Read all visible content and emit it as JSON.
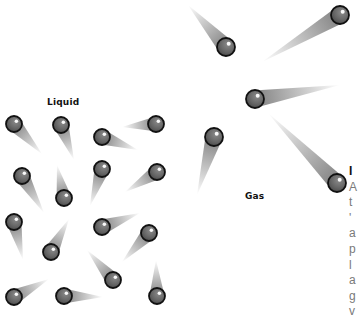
{
  "figure": {
    "background": "#ffffff",
    "ball_fill": "#6a6a6a",
    "ball_stroke": "#111111",
    "ball_highlight": "#ffffff",
    "tail_color": "#7a7a7a"
  },
  "labels": {
    "liquid": "Liquid",
    "gas": "Gas"
  },
  "liquid_particles": [
    {
      "x": 14,
      "y": 124,
      "tail_x": 42,
      "tail_y": 154
    },
    {
      "x": 61,
      "y": 125,
      "tail_x": 74,
      "tail_y": 160
    },
    {
      "x": 102,
      "y": 137,
      "tail_x": 138,
      "tail_y": 150
    },
    {
      "x": 156,
      "y": 124,
      "tail_x": 122,
      "tail_y": 127
    },
    {
      "x": 22,
      "y": 176,
      "tail_x": 44,
      "tail_y": 213
    },
    {
      "x": 64,
      "y": 198,
      "tail_x": 57,
      "tail_y": 165
    },
    {
      "x": 102,
      "y": 169,
      "tail_x": 90,
      "tail_y": 206
    },
    {
      "x": 157,
      "y": 172,
      "tail_x": 125,
      "tail_y": 192
    },
    {
      "x": 14,
      "y": 222,
      "tail_x": 23,
      "tail_y": 260
    },
    {
      "x": 51,
      "y": 252,
      "tail_x": 69,
      "tail_y": 219
    },
    {
      "x": 102,
      "y": 227,
      "tail_x": 140,
      "tail_y": 213
    },
    {
      "x": 149,
      "y": 233,
      "tail_x": 122,
      "tail_y": 262
    },
    {
      "x": 113,
      "y": 280,
      "tail_x": 87,
      "tail_y": 250
    },
    {
      "x": 14,
      "y": 297,
      "tail_x": 49,
      "tail_y": 279
    },
    {
      "x": 64,
      "y": 296,
      "tail_x": 103,
      "tail_y": 297
    },
    {
      "x": 157,
      "y": 296,
      "tail_x": 156,
      "tail_y": 260
    }
  ],
  "gas_particles": [
    {
      "x": 226,
      "y": 47,
      "tail_x": 188,
      "tail_y": 5
    },
    {
      "x": 340,
      "y": 15,
      "tail_x": 262,
      "tail_y": 62
    },
    {
      "x": 255,
      "y": 99,
      "tail_x": 340,
      "tail_y": 85
    },
    {
      "x": 214,
      "y": 137,
      "tail_x": 197,
      "tail_y": 195
    },
    {
      "x": 337,
      "y": 183,
      "tail_x": 268,
      "tail_y": 113
    }
  ],
  "side_text": {
    "heading": "I",
    "lines": [
      "A",
      "t",
      "'",
      "a",
      "p",
      "l",
      "a"
    ],
    "link": "g",
    "last": "v"
  }
}
